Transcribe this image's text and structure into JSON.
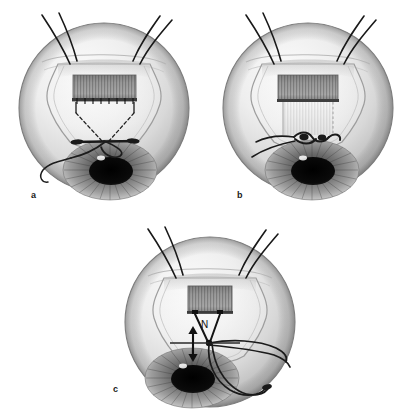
{
  "figure": {
    "background_color": "#ffffff",
    "width": 411,
    "height": 416,
    "panel_count": 3
  },
  "panels": [
    {
      "id": "a",
      "label": "a",
      "caption_position": "bottom-left",
      "center_x": 104,
      "center_y": 108,
      "radius": 85,
      "description": "Eye globe with conjunctival flap retracted, scleral patch graft in place, dashed suture paths converging to a loose suture loop lying over the sclera; four traction sutures exit superiorly.",
      "features": {
        "graft_present": true,
        "graft_shaded": true,
        "sutures_dashed": true,
        "suture_loop": "loose open loop",
        "knot_tied": false,
        "traction_sutures": 4
      }
    },
    {
      "id": "b",
      "label": "b",
      "caption_position": "bottom-left",
      "center_x": 308,
      "center_y": 108,
      "radius": 85,
      "description": "Same eye with the graft drawn inferiorly; the suture has been tied forming a visible knot with two free tails extending to the left over the sclera.",
      "features": {
        "graft_present": true,
        "graft_shaded": true,
        "graft_extension_pale": true,
        "sutures_dashed": false,
        "suture_loop": "tied knot with free tails",
        "knot_tied": true,
        "traction_sutures": 4
      }
    },
    {
      "id": "c",
      "label": "c",
      "caption_position": "bottom-left",
      "center_x": 210,
      "center_y": 322,
      "radius": 85,
      "description": "Eye with shorter graft; two sutures converge to a single node marked N. A vertical double-headed arrow beside N indicates the direction of adjustment/tension. Long suture strands sweep to the right and loop inferiorly across the cornea.",
      "features": {
        "graft_present": true,
        "graft_shaded": true,
        "sutures_dashed": false,
        "node_marker": "N",
        "arrow": "vertical double-headed",
        "arrow_meaning": "adjustable tension direction",
        "knot_tied": false,
        "traction_sutures": 4
      }
    }
  ],
  "annotations": {
    "node_label": "N",
    "node_label_meaning": "suture node / knot point"
  },
  "colors": {
    "background": "#ffffff",
    "globe_light": "#f2f2f2",
    "globe_mid": "#cfcfcf",
    "globe_shadow": "#9a9a9a",
    "globe_outline": "#6e6e6e",
    "graft_dark": "#787878",
    "graft_light": "#efefef",
    "suture_black": "#1a1a1a",
    "iris_mid": "#8e8e8e",
    "iris_dark": "#4a4a4a",
    "pupil": "#0d0d0d",
    "label_text": "#1a1a1a"
  }
}
